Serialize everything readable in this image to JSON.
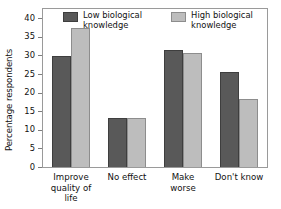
{
  "chart_data": {
    "type": "bar",
    "title": "",
    "xlabel": "",
    "ylabel": "Percentage respondents",
    "ylim": [
      0,
      42.5
    ],
    "yticks": [
      0,
      5,
      10,
      15,
      20,
      25,
      30,
      35,
      40
    ],
    "ytick_labels": [
      "0",
      "5",
      "10",
      "15",
      "20",
      "25",
      "30",
      "35",
      "40"
    ],
    "grid": false,
    "legend_position": "upper-left-inside",
    "categories": [
      "Improve\nquality of life",
      "No effect",
      "Make\nworse",
      "Don't know"
    ],
    "series": [
      {
        "name": "Low biological\nknowledge",
        "color": "#595959",
        "values": [
          29.8,
          13.1,
          31.4,
          25.6
        ]
      },
      {
        "name": "High biological\nknowledge",
        "color": "#bdbdbd",
        "values": [
          37.5,
          13.1,
          30.7,
          18.3
        ]
      }
    ]
  },
  "legend": {
    "items": [
      {
        "label": "Low biological\nknowledge",
        "swatch": "low"
      },
      {
        "label": "High biological\nknowledge",
        "swatch": "high"
      }
    ]
  }
}
